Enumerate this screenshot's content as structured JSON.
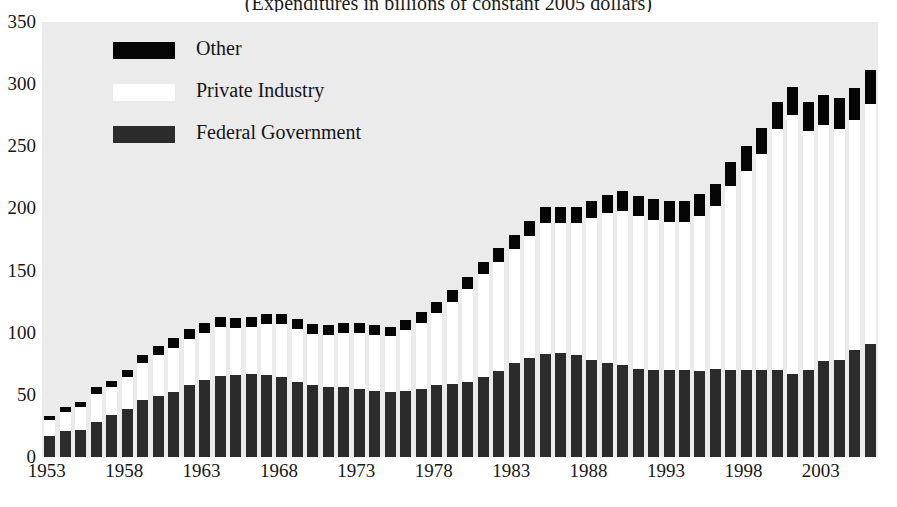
{
  "chart_data": {
    "type": "bar",
    "stacked": true,
    "title": "(Expenditures in billions of constant 2005 dollars)",
    "xlabel": "",
    "ylabel": "",
    "ylim": [
      0,
      350
    ],
    "ytick_values": [
      0,
      50,
      100,
      150,
      200,
      250,
      300,
      350
    ],
    "ytick_labels": [
      "0",
      "50",
      "100",
      "150",
      "200",
      "250",
      "300",
      "350"
    ],
    "grid": false,
    "legend_position": "upper-left-inside",
    "plot_background": "#ebebeb",
    "x": [
      1953,
      1954,
      1955,
      1956,
      1957,
      1958,
      1959,
      1960,
      1961,
      1962,
      1963,
      1964,
      1965,
      1966,
      1967,
      1968,
      1969,
      1970,
      1971,
      1972,
      1973,
      1974,
      1975,
      1976,
      1977,
      1978,
      1979,
      1980,
      1981,
      1982,
      1983,
      1984,
      1985,
      1986,
      1987,
      1988,
      1989,
      1990,
      1991,
      1992,
      1993,
      1994,
      1995,
      1996,
      1997,
      1998,
      1999,
      2000,
      2001,
      2002,
      2003,
      2004,
      2005,
      2006
    ],
    "xtick_labels": [
      "1953",
      "1958",
      "1963",
      "1968",
      "1973",
      "1978",
      "1983",
      "1988",
      "1993",
      "1998",
      "2003"
    ],
    "xtick_values": [
      1953,
      1958,
      1963,
      1968,
      1973,
      1978,
      1983,
      1988,
      1993,
      1998,
      2003
    ],
    "series": [
      {
        "name": "Federal Government",
        "color": "#2b2b2b",
        "values": [
          17,
          21,
          22,
          28,
          34,
          39,
          46,
          49,
          52,
          58,
          62,
          65,
          66,
          67,
          66,
          64,
          60,
          58,
          56,
          56,
          55,
          53,
          52,
          53,
          55,
          58,
          59,
          60,
          64,
          69,
          76,
          80,
          83,
          84,
          82,
          78,
          76,
          74,
          71,
          70,
          70,
          70,
          69,
          71,
          70,
          70,
          70,
          70,
          67,
          70,
          77,
          78,
          86,
          91
        ]
      },
      {
        "name": "Private Industry",
        "color": "#ffffff",
        "values": [
          13,
          15,
          18,
          23,
          22,
          25,
          30,
          33,
          36,
          37,
          38,
          40,
          38,
          38,
          41,
          43,
          43,
          41,
          42,
          44,
          45,
          45,
          45,
          49,
          53,
          58,
          66,
          75,
          83,
          88,
          91,
          98,
          105,
          104,
          106,
          114,
          120,
          124,
          123,
          121,
          119,
          119,
          125,
          131,
          148,
          160,
          174,
          194,
          208,
          192,
          190,
          186,
          185,
          193
        ]
      },
      {
        "name": "Other",
        "color": "#050505",
        "values": [
          3,
          4,
          4,
          5,
          5,
          6,
          6,
          7,
          8,
          8,
          8,
          8,
          8,
          8,
          8,
          8,
          8,
          8,
          8,
          8,
          8,
          8,
          8,
          8,
          9,
          9,
          9,
          10,
          10,
          11,
          12,
          12,
          13,
          13,
          13,
          14,
          15,
          16,
          16,
          17,
          17,
          17,
          18,
          18,
          19,
          20,
          21,
          22,
          23,
          24,
          24,
          25,
          26,
          27
        ]
      }
    ]
  },
  "legend": {
    "items": [
      {
        "label": "Other",
        "color": "#050505"
      },
      {
        "label": "Private Industry",
        "color": "#ffffff"
      },
      {
        "label": "Federal Government",
        "color": "#2b2b2b"
      }
    ]
  }
}
